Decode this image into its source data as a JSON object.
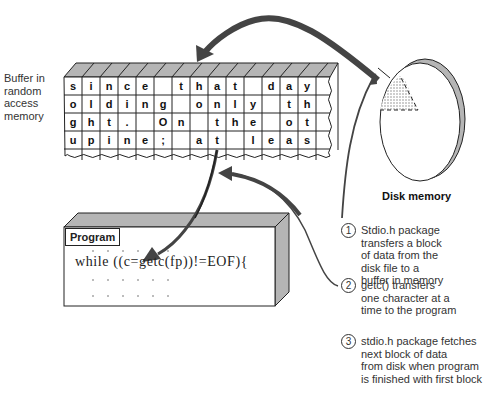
{
  "buffer": {
    "label": "Buffer in\nrandom\naccess\nmemory",
    "rows": [
      [
        "s",
        "i",
        "n",
        "c",
        "e",
        "",
        "t",
        "h",
        "a",
        "t",
        "",
        "d",
        "a",
        "y"
      ],
      [
        "o",
        "l",
        "d",
        "i",
        "n",
        "g",
        "",
        "o",
        "n",
        "l",
        "y",
        "",
        "t",
        "h"
      ],
      [
        "g",
        "h",
        "t",
        ".",
        "",
        "O",
        "n",
        "",
        "t",
        "h",
        "e",
        "",
        "o",
        "t"
      ],
      [
        "u",
        "p",
        "i",
        "n",
        "e",
        ";",
        "",
        "a",
        "t",
        "",
        "l",
        "e",
        "a",
        "s"
      ]
    ]
  },
  "disk": {
    "label": "Disk memory"
  },
  "program": {
    "title": "Program",
    "code": "while ((c=getc(fp))!=EOF){"
  },
  "steps": [
    {
      "num": "1",
      "text": "Stdio.h package\ntransfers a block\nof data from the\ndisk file to a\nbuffer in memory"
    },
    {
      "num": "2",
      "text": "getc() transfers\none character at a\ntime to the program"
    },
    {
      "num": "3",
      "text": "stdio.h package fetches\nnext block of data\nfrom disk when program\nis finished with first block"
    }
  ],
  "colors": {
    "shade": "#b5b5b5",
    "ink": "#222222",
    "arrow": "#444444"
  }
}
